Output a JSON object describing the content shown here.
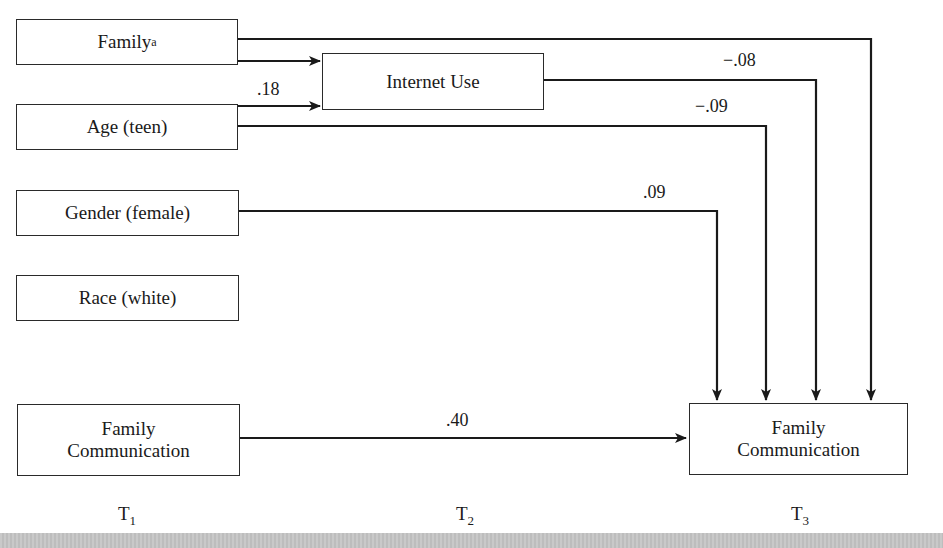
{
  "nodes": {
    "family": {
      "label": "Family",
      "superscript": "a"
    },
    "age": {
      "label": "Age (teen)"
    },
    "gender": {
      "label": "Gender (female)"
    },
    "race": {
      "label": "Race (white)"
    },
    "family_comm_t1": {
      "line1": "Family",
      "line2": "Communication"
    },
    "internet_use": {
      "label": "Internet Use"
    },
    "family_comm_t3": {
      "line1": "Family",
      "line2": "Communication"
    }
  },
  "paths": {
    "age_to_internet": ".18",
    "internet_to_comm": "−.08",
    "age_to_comm": "−.09",
    "gender_to_comm": ".09",
    "comm_t1_to_comm_t3": ".40"
  },
  "time_points": {
    "t1": {
      "base": "T",
      "sub": "1"
    },
    "t2": {
      "base": "T",
      "sub": "2"
    },
    "t3": {
      "base": "T",
      "sub": "3"
    }
  },
  "colors": {
    "line": "#1a1a1a",
    "strip": "#c4c4c4"
  }
}
